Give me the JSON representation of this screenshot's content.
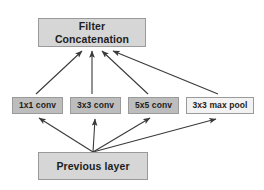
{
  "diagram": {
    "background_color": "#ffffff",
    "edge_color": "#3a3a3a",
    "nodes": {
      "concatenation": {
        "label": "Filter\nConcatenation",
        "fill": "#d6d6d6",
        "border": "#9a9a9a"
      },
      "previous_layer": {
        "label": "Previous layer",
        "fill": "#d6d6d6",
        "border": "#9a9a9a"
      },
      "conv1x1": {
        "label": "1x1 conv",
        "fill": "#bdbdbd",
        "border": "#9a9a9a"
      },
      "conv3x3": {
        "label": "3x3 conv",
        "fill": "#bdbdbd",
        "border": "#9a9a9a"
      },
      "conv5x5": {
        "label": "5x5 conv",
        "fill": "#bdbdbd",
        "border": "#9a9a9a"
      },
      "maxpool3x3": {
        "label": "3x3 max pool",
        "fill": "#f2f2f2",
        "border": "#9a9a9a"
      }
    },
    "edges": [
      {
        "from": "previous_layer",
        "to": "conv1x1"
      },
      {
        "from": "previous_layer",
        "to": "conv3x3"
      },
      {
        "from": "previous_layer",
        "to": "conv5x5"
      },
      {
        "from": "previous_layer",
        "to": "maxpool3x3"
      },
      {
        "from": "conv1x1",
        "to": "concatenation"
      },
      {
        "from": "conv3x3",
        "to": "concatenation"
      },
      {
        "from": "conv5x5",
        "to": "concatenation"
      },
      {
        "from": "maxpool3x3",
        "to": "concatenation"
      }
    ]
  }
}
